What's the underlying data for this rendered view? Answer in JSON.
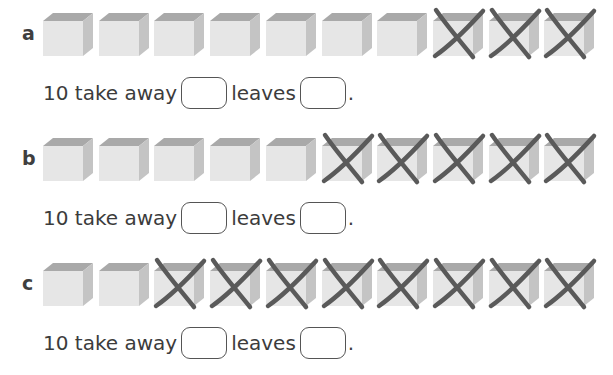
{
  "colors": {
    "cube_front": "#e6e6e6",
    "cube_top": "#a9a9a9",
    "cube_side": "#c4c4c4",
    "cross": "#5a5a5a",
    "text": "#3c3c3c"
  },
  "questions": [
    {
      "letter": "a",
      "total": 10,
      "crossed": 3,
      "text_before": "10 take away",
      "text_middle": "leaves",
      "text_end": ".",
      "box1_value": "",
      "box2_value": ""
    },
    {
      "letter": "b",
      "total": 10,
      "crossed": 5,
      "text_before": "10 take away",
      "text_middle": "leaves",
      "text_end": ".",
      "box1_value": "",
      "box2_value": ""
    },
    {
      "letter": "c",
      "total": 10,
      "crossed": 8,
      "text_before": "10 take away",
      "text_middle": "leaves",
      "text_end": ".",
      "box1_value": "",
      "box2_value": ""
    }
  ]
}
